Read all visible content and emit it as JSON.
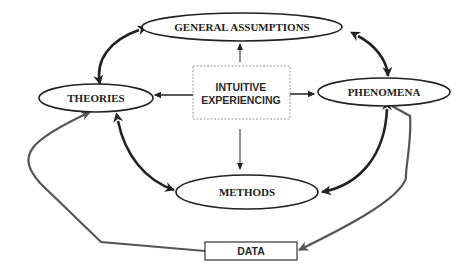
{
  "diagram": {
    "nodes": {
      "general_assumptions": {
        "label": "GENERAL ASSUMPTIONS",
        "shape": "ellipse"
      },
      "theories": {
        "label": "THEORIES",
        "shape": "ellipse"
      },
      "phenomena": {
        "label": "PHENOMENA",
        "shape": "ellipse"
      },
      "methods": {
        "label": "METHODS",
        "shape": "ellipse"
      },
      "intuitive_experiencing": {
        "label_line1": "INTUITIVE",
        "label_line2": "EXPERIENCING",
        "shape": "dashed-rectangle"
      },
      "data": {
        "label": "DATA",
        "shape": "rectangle"
      }
    },
    "edges": [
      {
        "from": "intuitive_experiencing",
        "to": "general_assumptions",
        "style": "thin-arrow"
      },
      {
        "from": "intuitive_experiencing",
        "to": "theories",
        "style": "thin-arrow"
      },
      {
        "from": "intuitive_experiencing",
        "to": "phenomena",
        "style": "thin-arrow"
      },
      {
        "from": "intuitive_experiencing",
        "to": "methods",
        "style": "thin-arrow"
      },
      {
        "from": "general_assumptions",
        "to": "theories",
        "style": "bold-double-arrow"
      },
      {
        "from": "general_assumptions",
        "to": "phenomena",
        "style": "bold-double-arrow"
      },
      {
        "from": "theories",
        "to": "methods",
        "style": "bold-double-arrow"
      },
      {
        "from": "phenomena",
        "to": "methods",
        "style": "bold-double-arrow"
      },
      {
        "from": "phenomena",
        "to": "data",
        "style": "gray-arrow"
      },
      {
        "from": "data",
        "to": "theories",
        "style": "gray-arrow"
      }
    ],
    "colors": {
      "stroke": "#222222",
      "feedback_stroke": "#555555",
      "dashed_box": "#888888"
    }
  }
}
